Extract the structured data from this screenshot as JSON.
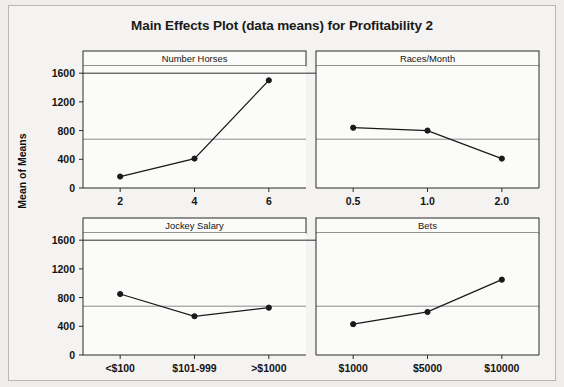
{
  "chart_data": {
    "type": "line",
    "title": "Main Effects Plot (data means) for Profitability 2",
    "ylabel": "Mean of Means",
    "xlabel": "",
    "ylim": [
      0,
      1700
    ],
    "yticks": [
      0,
      400,
      800,
      1200,
      1600
    ],
    "ytick_labels": [
      "0",
      "400",
      "800",
      "1200",
      "1600"
    ],
    "grid": false,
    "reference_line": 680,
    "legend": "none",
    "panels": [
      {
        "name": "Number Horses",
        "categories": [
          "2",
          "4",
          "6"
        ],
        "values": [
          160,
          410,
          1500
        ]
      },
      {
        "name": "Races/Month",
        "categories": [
          "0.5",
          "1.0",
          "2.0"
        ],
        "values": [
          840,
          800,
          410
        ]
      },
      {
        "name": "Jockey Salary",
        "categories": [
          "<$100",
          "$101-999",
          ">$1000"
        ],
        "values": [
          850,
          540,
          660
        ]
      },
      {
        "name": "Bets",
        "categories": [
          "$1000",
          "$5000",
          "$10000"
        ],
        "values": [
          430,
          600,
          1050
        ]
      }
    ],
    "colors": {
      "line": "#1a1a1a",
      "marker": "#1a1a1a",
      "reference_line": "#8c8c8c",
      "axis": "#2b2b2b",
      "panel_background": "#fbfbfa",
      "figure_background": "#f4f3f1"
    }
  }
}
